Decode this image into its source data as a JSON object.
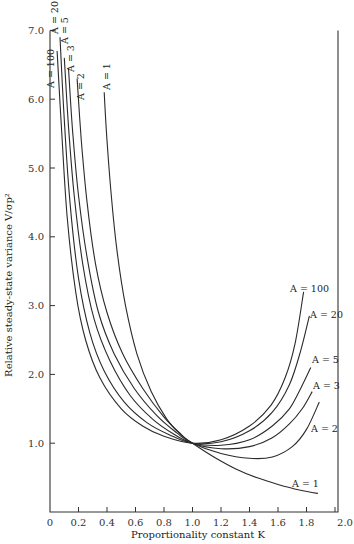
{
  "chart_data": {
    "type": "line",
    "title": "",
    "xlabel": "Proportionality constant K",
    "ylabel": "Relative steady-state variance V/σp²",
    "xlim": [
      0,
      2.0
    ],
    "ylim": [
      0,
      7.0
    ],
    "grid": false,
    "legend": "inline labels next to each curve",
    "x_ticks": [
      "0",
      "0.2",
      "0.4",
      "0.6",
      "0.8",
      "1.0",
      "1.2",
      "1.4",
      "1.6",
      "1.8",
      "2.0"
    ],
    "y_ticks": [
      "1.0",
      "2.0",
      "3.0",
      "4.0",
      "5.0",
      "6.0",
      "7.0"
    ],
    "series": [
      {
        "name": "A = 100",
        "label_pos": "top-left rotated, right end",
        "points": [
          [
            0.05,
            6.7
          ],
          [
            0.08,
            5.6
          ],
          [
            0.12,
            4.3
          ],
          [
            0.18,
            3.2
          ],
          [
            0.25,
            2.5
          ],
          [
            0.35,
            1.95
          ],
          [
            0.5,
            1.5
          ],
          [
            0.65,
            1.25
          ],
          [
            0.8,
            1.1
          ],
          [
            1.0,
            1.0
          ],
          [
            1.2,
            1.05
          ],
          [
            1.4,
            1.25
          ],
          [
            1.55,
            1.55
          ],
          [
            1.65,
            1.95
          ],
          [
            1.72,
            2.45
          ],
          [
            1.78,
            3.2
          ]
        ]
      },
      {
        "name": "A = 20",
        "points": [
          [
            0.07,
            6.9
          ],
          [
            0.1,
            5.7
          ],
          [
            0.14,
            4.5
          ],
          [
            0.2,
            3.4
          ],
          [
            0.28,
            2.6
          ],
          [
            0.38,
            2.05
          ],
          [
            0.52,
            1.6
          ],
          [
            0.68,
            1.3
          ],
          [
            0.84,
            1.12
          ],
          [
            1.0,
            1.0
          ],
          [
            1.2,
            1.02
          ],
          [
            1.4,
            1.18
          ],
          [
            1.56,
            1.45
          ],
          [
            1.68,
            1.85
          ],
          [
            1.76,
            2.35
          ],
          [
            1.82,
            2.85
          ]
        ]
      },
      {
        "name": "A = 5",
        "points": [
          [
            0.1,
            6.6
          ],
          [
            0.13,
            5.6
          ],
          [
            0.17,
            4.6
          ],
          [
            0.23,
            3.6
          ],
          [
            0.31,
            2.8
          ],
          [
            0.42,
            2.2
          ],
          [
            0.56,
            1.7
          ],
          [
            0.72,
            1.35
          ],
          [
            0.87,
            1.13
          ],
          [
            1.0,
            1.0
          ],
          [
            1.2,
            0.97
          ],
          [
            1.4,
            1.05
          ],
          [
            1.56,
            1.25
          ],
          [
            1.68,
            1.5
          ],
          [
            1.76,
            1.8
          ],
          [
            1.83,
            2.1
          ]
        ]
      },
      {
        "name": "A = 3",
        "points": [
          [
            0.13,
            6.45
          ],
          [
            0.16,
            5.5
          ],
          [
            0.2,
            4.6
          ],
          [
            0.26,
            3.7
          ],
          [
            0.34,
            2.9
          ],
          [
            0.45,
            2.3
          ],
          [
            0.59,
            1.8
          ],
          [
            0.75,
            1.4
          ],
          [
            0.89,
            1.15
          ],
          [
            1.0,
            1.0
          ],
          [
            1.2,
            0.92
          ],
          [
            1.4,
            0.95
          ],
          [
            1.56,
            1.08
          ],
          [
            1.68,
            1.28
          ],
          [
            1.77,
            1.5
          ],
          [
            1.84,
            1.75
          ]
        ]
      },
      {
        "name": "A = 2",
        "points": [
          [
            0.19,
            6.3
          ],
          [
            0.22,
            5.4
          ],
          [
            0.26,
            4.5
          ],
          [
            0.32,
            3.6
          ],
          [
            0.4,
            2.9
          ],
          [
            0.51,
            2.3
          ],
          [
            0.65,
            1.8
          ],
          [
            0.8,
            1.38
          ],
          [
            0.92,
            1.13
          ],
          [
            1.0,
            1.0
          ],
          [
            1.2,
            0.85
          ],
          [
            1.4,
            0.78
          ],
          [
            1.56,
            0.8
          ],
          [
            1.7,
            0.95
          ],
          [
            1.8,
            1.2
          ],
          [
            1.89,
            1.6
          ]
        ]
      },
      {
        "name": "A = 1",
        "points": [
          [
            0.38,
            6.1
          ],
          [
            0.4,
            5.4
          ],
          [
            0.43,
            4.6
          ],
          [
            0.47,
            3.8
          ],
          [
            0.53,
            3.0
          ],
          [
            0.61,
            2.3
          ],
          [
            0.71,
            1.75
          ],
          [
            0.82,
            1.35
          ],
          [
            0.92,
            1.12
          ],
          [
            1.0,
            1.0
          ],
          [
            1.15,
            0.8
          ],
          [
            1.3,
            0.63
          ],
          [
            1.45,
            0.5
          ],
          [
            1.6,
            0.4
          ],
          [
            1.75,
            0.32
          ],
          [
            1.88,
            0.27
          ]
        ]
      }
    ]
  },
  "labels": {
    "xlabel": "Proportionality constant K",
    "ylabel": "Relative steady-state variance V/σp²"
  }
}
